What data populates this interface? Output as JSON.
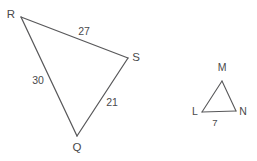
{
  "figure": {
    "background_color": "#ffffff",
    "stroke_color": "#58585a",
    "text_color": "#4a4a4c",
    "triangles": [
      {
        "name": "triangle-rqs",
        "vertices": [
          {
            "id": "R",
            "label": "R",
            "x": 21,
            "y": 17,
            "label_x": 11,
            "label_y": 18
          },
          {
            "id": "S",
            "label": "S",
            "x": 128,
            "y": 58,
            "label_x": 136,
            "label_y": 61
          },
          {
            "id": "Q",
            "label": "Q",
            "x": 77,
            "y": 136,
            "label_x": 77,
            "label_y": 151
          }
        ],
        "sides": [
          {
            "from": "R",
            "to": "S",
            "length_label": "27",
            "label_x": 84,
            "label_y": 35
          },
          {
            "from": "R",
            "to": "Q",
            "length_label": "30",
            "label_x": 38,
            "label_y": 84
          },
          {
            "from": "S",
            "to": "Q",
            "length_label": "21",
            "label_x": 112,
            "label_y": 106
          }
        ]
      },
      {
        "name": "triangle-lmn",
        "vertices": [
          {
            "id": "M",
            "label": "M",
            "x": 222,
            "y": 81,
            "label_x": 222,
            "label_y": 71
          },
          {
            "id": "L",
            "label": "L",
            "x": 202,
            "y": 112,
            "label_x": 195,
            "label_y": 115
          },
          {
            "id": "N",
            "label": "N",
            "x": 236,
            "y": 111,
            "label_x": 243,
            "label_y": 115
          }
        ],
        "sides": [
          {
            "from": "L",
            "to": "N",
            "length_label": "7",
            "label_x": 215,
            "label_y": 126
          },
          {
            "from": "M",
            "to": "L",
            "length_label": "",
            "label_x": 0,
            "label_y": 0
          },
          {
            "from": "M",
            "to": "N",
            "length_label": "",
            "label_x": 0,
            "label_y": 0
          }
        ]
      }
    ]
  }
}
